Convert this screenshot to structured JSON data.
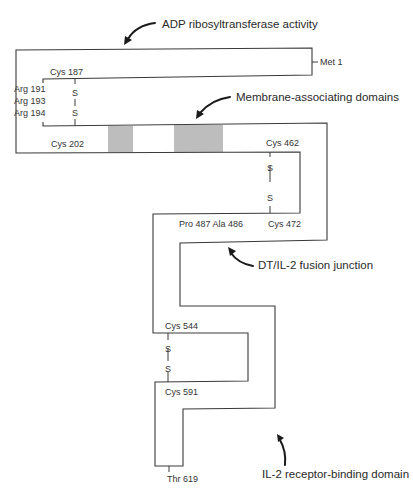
{
  "diagram": {
    "annotations": {
      "adp": "ADP ribosyltransferase activity",
      "membrane": "Membrane-associating domains",
      "fusion": "DT/IL-2 fusion junction",
      "il2": "IL-2 receptor-binding domain"
    },
    "residues": {
      "met1": "Met 1",
      "cys187": "Cys 187",
      "arg191": "Arg 191",
      "arg193": "Arg 193",
      "arg194": "Arg 194",
      "cys202": "Cys 202",
      "cys462": "Cys 462",
      "cys472": "Cys 472",
      "pro487_ala486": "Pro 487 Ala 486",
      "cys544": "Cys 544",
      "cys591": "Cys 591",
      "thr619": "Thr 619"
    },
    "disulfide": {
      "s": "S",
      "bond": "|"
    },
    "colors": {
      "line": "#3a3a3a",
      "membrane_band": "#bdbdbd",
      "arrow": "#1a1a1a"
    }
  }
}
